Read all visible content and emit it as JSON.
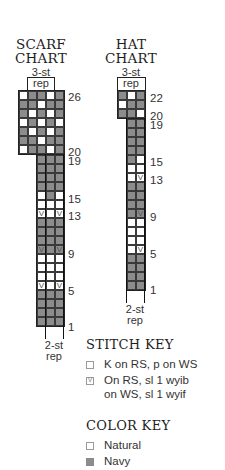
{
  "scarf_chart": {
    "title_line1": "SCARF",
    "title_line2": "CHART",
    "top_rep_label_1": "3-st",
    "top_rep_label_2": "rep",
    "bottom_rep_label_1": "2-st",
    "bottom_rep_label_2": "rep",
    "row_labels": [
      "26",
      "20",
      "19",
      "15",
      "13",
      "9",
      "5",
      "1"
    ],
    "top_rows": [
      {
        "row": 26,
        "cells": [
          "W",
          "N",
          "N",
          "W",
          "N"
        ]
      },
      {
        "row": 25,
        "cells": [
          "N",
          "N",
          "W",
          "N",
          "N"
        ]
      },
      {
        "row": 24,
        "cells": [
          "N",
          "W",
          "N",
          "W",
          "N"
        ]
      },
      {
        "row": 23,
        "cells": [
          "W",
          "N",
          "W",
          "N",
          "W"
        ]
      },
      {
        "row": 22,
        "cells": [
          "N",
          "W",
          "N",
          "W",
          "N"
        ]
      },
      {
        "row": 21,
        "cells": [
          "N",
          "N",
          "W",
          "N",
          "N"
        ]
      },
      {
        "row": 20,
        "cells": [
          "W",
          "N",
          "N",
          "W",
          "N"
        ]
      }
    ],
    "bottom_rows": [
      {
        "row": 19,
        "cells": [
          "N",
          "N",
          "N"
        ]
      },
      {
        "row": 18,
        "cells": [
          "N",
          "N",
          "N"
        ]
      },
      {
        "row": 17,
        "cells": [
          "N",
          "N",
          "N"
        ]
      },
      {
        "row": 16,
        "cells": [
          "N",
          "N",
          "N"
        ]
      },
      {
        "row": 15,
        "cells": [
          "W",
          "N",
          "W"
        ]
      },
      {
        "row": 14,
        "cells": [
          "W",
          "W",
          "W"
        ]
      },
      {
        "row": 13,
        "cells": [
          "WV",
          "W",
          "WV"
        ]
      },
      {
        "row": 12,
        "cells": [
          "N",
          "N",
          "N"
        ]
      },
      {
        "row": 11,
        "cells": [
          "N",
          "N",
          "N"
        ]
      },
      {
        "row": 10,
        "cells": [
          "N",
          "N",
          "N"
        ]
      },
      {
        "row": 9,
        "cells": [
          "NV",
          "N",
          "NV"
        ]
      },
      {
        "row": 8,
        "cells": [
          "W",
          "W",
          "W"
        ]
      },
      {
        "row": 7,
        "cells": [
          "W",
          "W",
          "W"
        ]
      },
      {
        "row": 6,
        "cells": [
          "W",
          "W",
          "W"
        ]
      },
      {
        "row": 5,
        "cells": [
          "WV",
          "W",
          "WV"
        ]
      },
      {
        "row": 4,
        "cells": [
          "N",
          "N",
          "N"
        ]
      },
      {
        "row": 3,
        "cells": [
          "N",
          "N",
          "N"
        ]
      },
      {
        "row": 2,
        "cells": [
          "N",
          "N",
          "N"
        ]
      },
      {
        "row": 1,
        "cells": [
          "N",
          "N",
          "N"
        ]
      }
    ]
  },
  "hat_chart": {
    "title_line1": "HAT",
    "title_line2": "CHART",
    "top_rep_label_1": "3-st",
    "top_rep_label_2": "rep",
    "bottom_rep_label_1": "2-st",
    "bottom_rep_label_2": "rep",
    "row_labels": [
      "22",
      "20",
      "19",
      "15",
      "13",
      "9",
      "5",
      "1"
    ],
    "top_rows": [
      {
        "row": 22,
        "cells": [
          "N",
          "W",
          "N"
        ]
      },
      {
        "row": 21,
        "cells": [
          "W",
          "N",
          "N"
        ]
      },
      {
        "row": 20,
        "cells": [
          "N",
          "N",
          "W"
        ]
      }
    ],
    "bottom_rows": [
      {
        "row": 19,
        "cells": [
          "N",
          "N"
        ]
      },
      {
        "row": 18,
        "cells": [
          "N",
          "N"
        ]
      },
      {
        "row": 17,
        "cells": [
          "N",
          "N"
        ]
      },
      {
        "row": 16,
        "cells": [
          "N",
          "N"
        ]
      },
      {
        "row": 15,
        "cells": [
          "N",
          "W"
        ]
      },
      {
        "row": 14,
        "cells": [
          "W",
          "W"
        ]
      },
      {
        "row": 13,
        "cells": [
          "W",
          "WV"
        ]
      },
      {
        "row": 12,
        "cells": [
          "N",
          "N"
        ]
      },
      {
        "row": 11,
        "cells": [
          "N",
          "N"
        ]
      },
      {
        "row": 10,
        "cells": [
          "N",
          "N"
        ]
      },
      {
        "row": 9,
        "cells": [
          "N",
          "NV"
        ]
      },
      {
        "row": 8,
        "cells": [
          "W",
          "W"
        ]
      },
      {
        "row": 7,
        "cells": [
          "W",
          "W"
        ]
      },
      {
        "row": 6,
        "cells": [
          "W",
          "W"
        ]
      },
      {
        "row": 5,
        "cells": [
          "W",
          "WV"
        ]
      },
      {
        "row": 4,
        "cells": [
          "N",
          "N"
        ]
      },
      {
        "row": 3,
        "cells": [
          "N",
          "N"
        ]
      },
      {
        "row": 2,
        "cells": [
          "N",
          "N"
        ]
      },
      {
        "row": 1,
        "cells": [
          "N",
          "N"
        ]
      }
    ]
  },
  "stitch_key": {
    "title": "STITCH KEY",
    "items": [
      {
        "symbol": "empty-square",
        "line1": "K on RS, p on WS",
        "line2": ""
      },
      {
        "symbol": "v-square",
        "line1": "On RS, sl 1 wyib",
        "line2": "on WS, sl 1 wyif"
      }
    ]
  },
  "color_key": {
    "title": "COLOR KEY",
    "items": [
      {
        "label": "Natural",
        "color": "#ffffff"
      },
      {
        "label": "Navy",
        "color": "#8c8c8c"
      }
    ]
  },
  "colors": {
    "navy_cell": "#8c8c8c",
    "natural_cell": "#ffffff",
    "grid_line": "#3a3a3a"
  }
}
